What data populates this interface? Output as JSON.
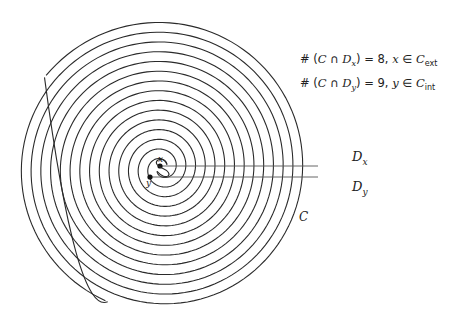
{
  "diagram": {
    "type": "double-spiral-jordan-curve",
    "curve_label": "C",
    "points": [
      {
        "name": "x",
        "label": "x",
        "cx": 160,
        "cy": 166
      },
      {
        "name": "y",
        "label": "y",
        "cx": 150,
        "cy": 177
      }
    ],
    "rays": [
      {
        "name": "D_x",
        "label_main": "D",
        "label_sub": "x",
        "y": 166,
        "x_start": 160,
        "x_end": 318
      },
      {
        "name": "D_y",
        "label_main": "D",
        "label_sub": "y",
        "y": 177,
        "x_start": 150,
        "x_end": 318
      }
    ],
    "annotations": [
      {
        "prefix": "# (",
        "set": "C",
        "cap": " ∩ ",
        "ray": "D",
        "ray_sub": "x",
        "close": ") = 8,  ",
        "pt": "x",
        "in": " ∈ ",
        "region": "C",
        "region_sub": "ext"
      },
      {
        "prefix": "# (",
        "set": "C",
        "cap": " ∩ ",
        "ray": "D",
        "ray_sub": "y",
        "close": ") = 9,  ",
        "pt": "y",
        "in": " ∈ ",
        "region": "C",
        "region_sub": "int"
      }
    ],
    "spiral": {
      "center_x": 162,
      "center_y": 168,
      "spacing": 19.5,
      "turns": 7.3,
      "stroke": "#2a2a2a"
    }
  }
}
